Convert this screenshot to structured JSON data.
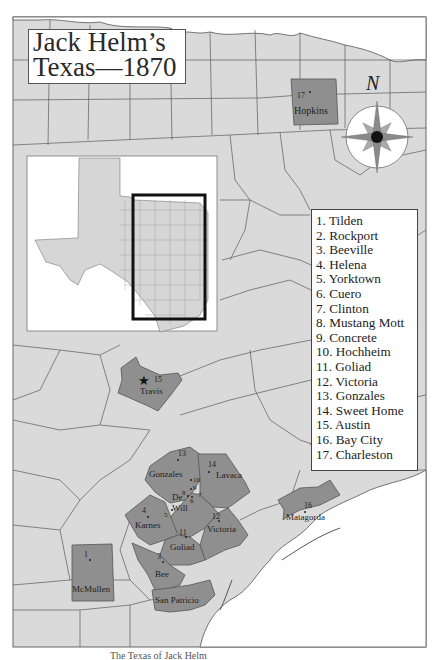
{
  "title": {
    "line1": "Jack Helm’s",
    "line2": "Texas—1870"
  },
  "compass": {
    "label": "N",
    "icon": "compass-rose-icon"
  },
  "legend": {
    "items": [
      "1. Tilden",
      "2. Rockport",
      "3. Beeville",
      "4. Helena",
      "5. Yorktown",
      "6. Cuero",
      "7. Clinton",
      "8. Mustang Mott",
      "9. Concrete",
      "10. Hochheim",
      "11. Goliad",
      "12. Victoria",
      "13. Gonzales",
      "14. Sweet Home",
      "15. Austin",
      "16. Bay City",
      "17. Charleston"
    ]
  },
  "highlighted_counties": [
    {
      "name": "Hopkins",
      "marker": "17"
    },
    {
      "name": "Travis",
      "marker": "15"
    },
    {
      "name": "Gonzales",
      "marker": "13"
    },
    {
      "name": "Lavaca",
      "marker": "14"
    },
    {
      "name": "De Witt",
      "label_line1": "De",
      "label_line2": "Witt",
      "markers": [
        "5",
        "6",
        "7",
        "8",
        "9",
        "10"
      ]
    },
    {
      "name": "Karnes",
      "marker": "4"
    },
    {
      "name": "Victoria",
      "marker": "12"
    },
    {
      "name": "Goliad",
      "marker": "11"
    },
    {
      "name": "Matagorda",
      "marker": "16"
    },
    {
      "name": "Bee",
      "marker": "3"
    },
    {
      "name": "McMullen",
      "marker": "1"
    },
    {
      "name": "San Patricio",
      "marker": "2"
    }
  ],
  "inset": {
    "description": "Texas state outline with selection rectangle"
  },
  "caption": "The Texas of Jack Helm",
  "colors": {
    "county_fill": "#d9d9d9",
    "highlight_fill": "#8f8f8f",
    "border": "#555555",
    "water": "#ffffff"
  }
}
